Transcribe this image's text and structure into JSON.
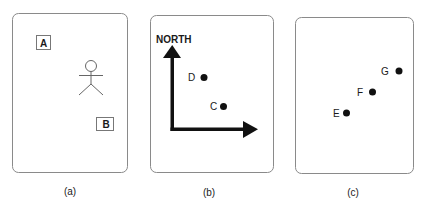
{
  "figure": {
    "panels": [
      {
        "id": "a",
        "caption": "(a)",
        "boxes": [
          {
            "label": "A"
          },
          {
            "label": "B"
          }
        ],
        "figure": "stick-person"
      },
      {
        "id": "b",
        "caption": "(b)",
        "axis_label": "NORTH",
        "points": [
          {
            "label": "D"
          },
          {
            "label": "C"
          }
        ]
      },
      {
        "id": "c",
        "caption": "(c)",
        "points": [
          {
            "label": "G"
          },
          {
            "label": "F"
          },
          {
            "label": "E"
          }
        ]
      }
    ]
  }
}
